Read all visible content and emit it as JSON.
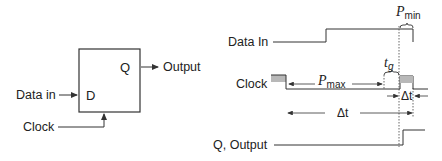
{
  "flipflop": {
    "input_d_label": "D",
    "output_q_label": "Q",
    "data_in_label": "Data in",
    "clock_label": "Clock",
    "output_label": "Output"
  },
  "timing": {
    "data_in_label": "Data In",
    "clock_label": "Clock",
    "output_label": "Q, Output",
    "p_min": {
      "symbol": "P",
      "subscript": "min"
    },
    "p_max": {
      "symbol": "P",
      "subscript": "max"
    },
    "t_g": {
      "symbol": "t",
      "subscript": "g"
    },
    "delta_t_small": "Δt",
    "delta_t_large": "Δt"
  },
  "colors": {
    "line": "#333333",
    "pulse_fill": "#b8b8b8",
    "dotted": "#555555"
  }
}
